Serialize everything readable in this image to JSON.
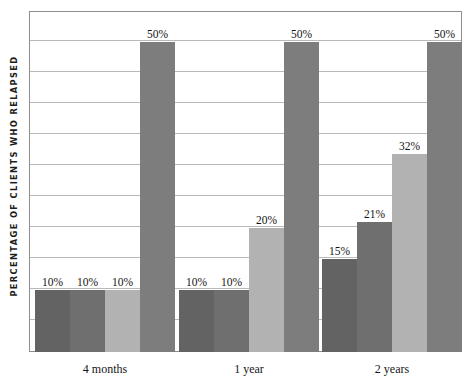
{
  "chart_data": {
    "type": "bar",
    "title": "",
    "xlabel": "",
    "ylabel": "PERCENTAGE OF CLIENTS WHO RELAPSED",
    "categories": [
      "4 months",
      "1 year",
      "2 years"
    ],
    "ylim": [
      0,
      55
    ],
    "grid": true,
    "gridline_step": 5,
    "gridline_count": 11,
    "legend": "none",
    "value_suffix": "%",
    "series": [
      {
        "name": "series-1",
        "color": "#636363",
        "values": [
          10,
          10,
          15
        ],
        "labels": [
          "10%",
          "10%",
          "15%"
        ]
      },
      {
        "name": "series-2",
        "color": "#6f6f6f",
        "values": [
          10,
          10,
          21
        ],
        "labels": [
          "10%",
          "10%",
          "21%"
        ]
      },
      {
        "name": "series-3",
        "color": "#b2b2b2",
        "values": [
          10,
          20,
          32
        ],
        "labels": [
          "10%",
          "20%",
          "32%"
        ]
      },
      {
        "name": "series-4",
        "color": "#7d7d7d",
        "values": [
          50,
          50,
          50
        ],
        "labels": [
          "50%",
          "50%",
          "50%"
        ]
      }
    ]
  },
  "style": {
    "plot_border_color": "#8e8e8e",
    "gridline_color": "#b9b9b9",
    "background": "#ffffff",
    "text_color": "#141414"
  }
}
